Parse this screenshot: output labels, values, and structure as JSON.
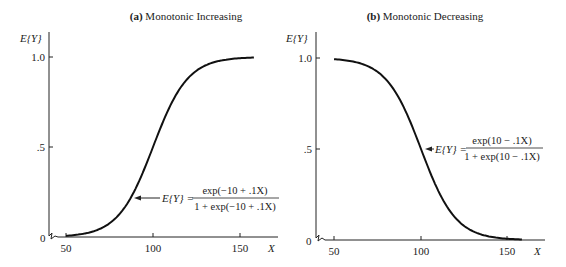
{
  "chart_data": [
    {
      "type": "line",
      "title_prefix": "(a)",
      "title": "Monotonic Increasing",
      "xlabel": "X",
      "ylabel": "E{Y}",
      "x_ticks": [
        "50",
        "100",
        "150"
      ],
      "y_ticks": [
        "0",
        ".5",
        "1.0"
      ],
      "xlim": [
        40,
        160
      ],
      "ylim": [
        0,
        1
      ],
      "equation_lhs": "E{Y} =",
      "equation_num": "exp(−10 + .1X)",
      "equation_den": "1 + exp(−10 + .1X)",
      "series": [
        {
          "name": "E{Y} = exp(-10+.1X)/(1+exp(-10+.1X))",
          "x": [
            50,
            60,
            70,
            80,
            90,
            100,
            110,
            120,
            130,
            140,
            150,
            158
          ],
          "y": [
            0.007,
            0.018,
            0.047,
            0.119,
            0.269,
            0.5,
            0.731,
            0.881,
            0.953,
            0.982,
            0.993,
            0.997
          ]
        }
      ]
    },
    {
      "type": "line",
      "title_prefix": "(b)",
      "title": "Monotonic Decreasing",
      "xlabel": "X",
      "ylabel": "E{Y}",
      "x_ticks": [
        "50",
        "100",
        "150"
      ],
      "y_ticks": [
        "0",
        ".5",
        "1.0"
      ],
      "xlim": [
        40,
        160
      ],
      "ylim": [
        0,
        1
      ],
      "equation_lhs": "E{Y} =",
      "equation_num": "exp(10 − .1X)",
      "equation_den": "1 + exp(10 − .1X)",
      "series": [
        {
          "name": "E{Y} = exp(10-.1X)/(1+exp(10-.1X))",
          "x": [
            50,
            60,
            70,
            80,
            90,
            100,
            110,
            120,
            130,
            140,
            150,
            158
          ],
          "y": [
            0.993,
            0.982,
            0.953,
            0.881,
            0.731,
            0.5,
            0.269,
            0.119,
            0.047,
            0.018,
            0.007,
            0.003
          ]
        }
      ]
    }
  ]
}
